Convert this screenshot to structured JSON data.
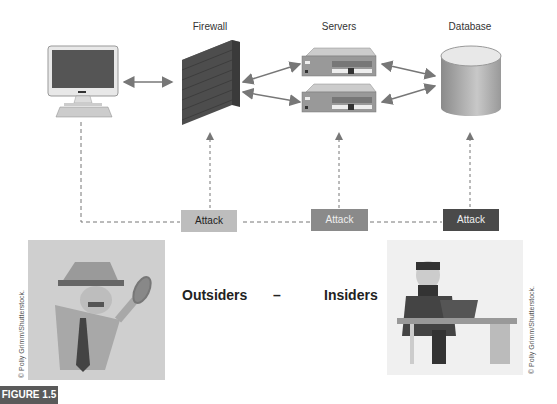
{
  "labels": {
    "firewall": "Firewall",
    "servers": "Servers",
    "database": "Database"
  },
  "attacks": [
    {
      "label": "Attack",
      "color": "#bdbdbd",
      "text_color": "#222222"
    },
    {
      "label": "Attack",
      "color": "#8a8a8a",
      "text_color": "#f0f0f0"
    },
    {
      "label": "Attack",
      "color": "#4a4a4a",
      "text_color": "#f0f0f0"
    }
  ],
  "bottom": {
    "outsiders": "Outsiders",
    "dash": "–",
    "insiders": "Insiders"
  },
  "credits": {
    "left": "© Polly Grimm/Shutterstock.",
    "right": "© Polly Grimm/Shutterstock."
  },
  "figure_label": "FIGURE 1.5"
}
